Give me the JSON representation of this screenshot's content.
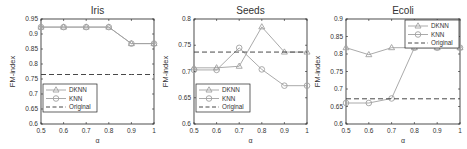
{
  "chart_data": [
    {
      "type": "line",
      "title": "Iris",
      "xlabel": "α",
      "ylabel": "FM-index",
      "x": [
        0.5,
        0.6,
        0.7,
        0.8,
        0.9,
        1.0
      ],
      "xticks": [
        "0.5",
        "0.6",
        "0.7",
        "0.8",
        "0.9",
        "1"
      ],
      "yticks": [
        "0.6",
        "0.65",
        "0.7",
        "0.75",
        "0.8",
        "0.85",
        "0.9",
        "0.95"
      ],
      "ylim": [
        0.6,
        0.95
      ],
      "xlim": [
        0.5,
        1.0
      ],
      "legend_position": "lower left",
      "series": [
        {
          "name": "DKNN",
          "marker": "triangle",
          "style": "solid",
          "values": [
            0.923,
            0.923,
            0.923,
            0.923,
            0.868,
            0.868
          ]
        },
        {
          "name": "KNN",
          "marker": "circle",
          "style": "solid",
          "values": [
            0.923,
            0.923,
            0.923,
            0.923,
            0.868,
            0.868
          ]
        },
        {
          "name": "Original",
          "marker": "none",
          "style": "dashed",
          "values": [
            0.765,
            0.765,
            0.765,
            0.765,
            0.765,
            0.765
          ]
        }
      ]
    },
    {
      "type": "line",
      "title": "Seeds",
      "xlabel": "α",
      "ylabel": "FM-index",
      "x": [
        0.5,
        0.6,
        0.7,
        0.8,
        0.9,
        1.0
      ],
      "xticks": [
        "0.5",
        "0.6",
        "0.7",
        "0.8",
        "0.9",
        "1"
      ],
      "yticks": [
        "0.6",
        "0.65",
        "0.7",
        "0.75",
        "0.8"
      ],
      "ylim": [
        0.6,
        0.8
      ],
      "xlim": [
        0.5,
        1.0
      ],
      "legend_position": "lower left",
      "series": [
        {
          "name": "DKNN",
          "marker": "triangle",
          "style": "solid",
          "values": [
            0.707,
            0.707,
            0.71,
            0.785,
            0.737,
            0.737
          ]
        },
        {
          "name": "KNN",
          "marker": "circle",
          "style": "solid",
          "values": [
            0.703,
            0.703,
            0.745,
            0.704,
            0.673,
            0.673
          ]
        },
        {
          "name": "Original",
          "marker": "none",
          "style": "dashed",
          "values": [
            0.737,
            0.737,
            0.737,
            0.737,
            0.737,
            0.737
          ]
        }
      ]
    },
    {
      "type": "line",
      "title": "Ecoli",
      "xlabel": "α",
      "ylabel": "FM-index",
      "x": [
        0.5,
        0.6,
        0.7,
        0.8,
        0.9,
        1.0
      ],
      "xticks": [
        "0.5",
        "0.6",
        "0.7",
        "0.8",
        "0.9",
        "1"
      ],
      "yticks": [
        "0.6",
        "0.65",
        "0.7",
        "0.75",
        "0.8",
        "0.85",
        "0.9"
      ],
      "ylim": [
        0.6,
        0.9
      ],
      "xlim": [
        0.5,
        1.0
      ],
      "legend_position": "upper right",
      "series": [
        {
          "name": "DKNN",
          "marker": "triangle",
          "style": "solid",
          "values": [
            0.818,
            0.798,
            0.818,
            0.818,
            0.818,
            0.818
          ]
        },
        {
          "name": "KNN",
          "marker": "circle",
          "style": "solid",
          "values": [
            0.66,
            0.66,
            0.673,
            0.818,
            0.818,
            0.818
          ]
        },
        {
          "name": "Original",
          "marker": "none",
          "style": "dashed",
          "values": [
            0.672,
            0.672,
            0.672,
            0.672,
            0.672,
            0.672
          ]
        }
      ]
    }
  ],
  "colors": {
    "line": "#a0a0a0",
    "dashed": "#333333",
    "axis": "#222222"
  }
}
